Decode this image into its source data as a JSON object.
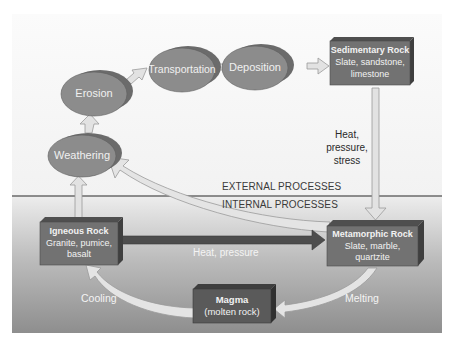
{
  "diagram": {
    "zones": {
      "external_label": "EXTERNAL PROCESSES",
      "internal_label": "INTERNAL PROCESSES"
    },
    "processes": [
      {
        "id": "weathering",
        "label": "Weathering"
      },
      {
        "id": "erosion",
        "label": "Erosion"
      },
      {
        "id": "transportation",
        "label": "Transportation"
      },
      {
        "id": "deposition",
        "label": "Deposition"
      }
    ],
    "rocks": {
      "sedimentary": {
        "title": "Sedimentary Rock",
        "line1": "Slate, sandstone,",
        "line2": "limestone"
      },
      "metamorphic": {
        "title": "Metamorphic Rock",
        "line1": "Slate, marble,",
        "line2": "quartzite"
      },
      "igneous": {
        "title": "Igneous Rock",
        "line1": "Granite, pumice,",
        "line2": "basalt"
      },
      "magma": {
        "title": "Magma",
        "line1": "(molten rock)"
      }
    },
    "arrow_labels": {
      "sed_to_meta_1": "Heat,",
      "sed_to_meta_2": "pressure,",
      "sed_to_meta_3": "stress",
      "ign_to_meta": "Heat, pressure",
      "cooling": "Cooling",
      "melting": "Melting"
    },
    "colors": {
      "ellipse_fill": "#8c8c8c",
      "ellipse_shadow": "#6e6e6e",
      "box_fill": "#6f6f6f",
      "box_top": "#555555",
      "box_side": "#444444",
      "arrow_fill": "#e2e2e2",
      "arrow_stroke": "#9a9a9a",
      "dark_arrow": "#4a4a4a",
      "internal_top": "#ececec",
      "internal_bottom": "#8f8f8f"
    }
  }
}
